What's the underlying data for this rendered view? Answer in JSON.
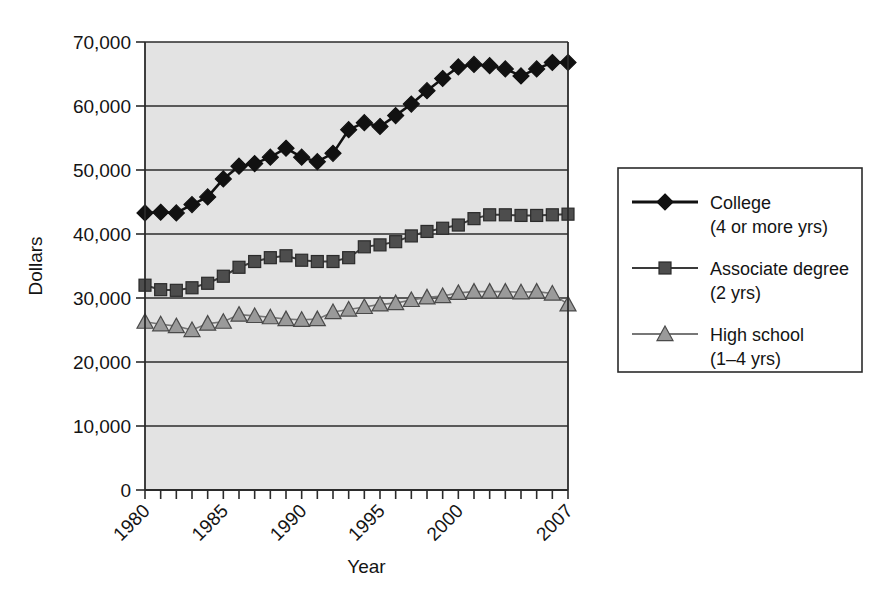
{
  "chart_data": {
    "type": "line",
    "title": "",
    "xlabel": "Year",
    "ylabel": "Dollars",
    "xlim": [
      1980,
      2007
    ],
    "ylim": [
      0,
      70000
    ],
    "grid": true,
    "legend_position": "right",
    "x": [
      1980,
      1981,
      1982,
      1983,
      1984,
      1985,
      1986,
      1987,
      1988,
      1989,
      1990,
      1991,
      1992,
      1993,
      1994,
      1995,
      1996,
      1997,
      1998,
      1999,
      2000,
      2001,
      2002,
      2003,
      2004,
      2005,
      2006,
      2007
    ],
    "x_tick_labels": [
      "1980",
      "1985",
      "1990",
      "1995",
      "2000",
      "2007"
    ],
    "x_tick_values": [
      1980,
      1985,
      1990,
      1995,
      2000,
      2007
    ],
    "y_tick_labels": [
      "0",
      "10,000",
      "20,000",
      "30,000",
      "40,000",
      "50,000",
      "60,000",
      "70,000"
    ],
    "y_tick_values": [
      0,
      10000,
      20000,
      30000,
      40000,
      50000,
      60000,
      70000
    ],
    "series": [
      {
        "name": "College",
        "name_detail": "(4 or more yrs)",
        "marker": "diamond",
        "color": "#111111",
        "line_color": "#111111",
        "values": [
          43300,
          43400,
          43300,
          44600,
          45800,
          48600,
          50600,
          51000,
          52000,
          53400,
          52000,
          51300,
          52600,
          56300,
          57400,
          56800,
          58500,
          60300,
          62400,
          64300,
          66100,
          66500,
          66300,
          65800,
          64700,
          65800,
          66800,
          66800
        ]
      },
      {
        "name": "Associate degree",
        "name_detail": "(2 yrs)",
        "marker": "square",
        "color": "#4d4d4d",
        "line_color": "#3a3a3a",
        "values": [
          32000,
          31300,
          31200,
          31600,
          32300,
          33400,
          34800,
          35700,
          36300,
          36600,
          35900,
          35700,
          35700,
          36300,
          38000,
          38300,
          38800,
          39700,
          40400,
          40900,
          41400,
          42400,
          43000,
          43000,
          42900,
          42900,
          43000,
          43100
        ]
      },
      {
        "name": "High school",
        "name_detail": "(1–4 yrs)",
        "marker": "triangle",
        "color": "#9a9a9a",
        "line_color": "#777777",
        "values": [
          26300,
          25900,
          25600,
          25000,
          26000,
          26300,
          27400,
          27200,
          27000,
          26700,
          26600,
          26700,
          27800,
          28200,
          28600,
          29000,
          29200,
          29700,
          30100,
          30300,
          30800,
          31000,
          31000,
          31000,
          30900,
          31000,
          30700,
          29000
        ]
      }
    ]
  },
  "axes": {
    "y_title": "Dollars",
    "x_title": "Year"
  },
  "legend": {
    "entries": [
      {
        "label": "College",
        "sublabel": "(4 or more yrs)",
        "marker": "diamond-icon"
      },
      {
        "label": "Associate degree",
        "sublabel": "(2 yrs)",
        "marker": "square-icon"
      },
      {
        "label": "High school",
        "sublabel": "(1–4 yrs)",
        "marker": "triangle-icon"
      }
    ]
  }
}
